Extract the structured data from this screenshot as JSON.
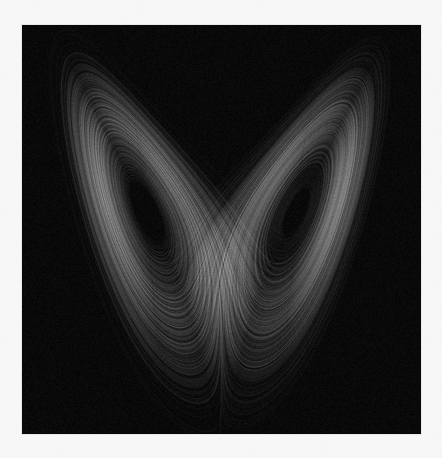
{
  "figure": {
    "kind": "lorenz-attractor-plot",
    "title": "",
    "caption": "",
    "page_background": "#f7f7f7",
    "plot_background": "#050505",
    "plot_border_color": "#e8e8e8",
    "plot_area": {
      "x": 22,
      "y": 25,
      "width": 399,
      "height": 409
    },
    "axes_visible": false,
    "ticks_visible": false,
    "gridlines_visible": false,
    "legend_visible": false,
    "labels_visible": false
  },
  "chart_data": {
    "type": "line",
    "title": "",
    "subtitle": "",
    "xlabel": "",
    "ylabel": "",
    "grid": false,
    "legend_position": "none",
    "projection": "x-z",
    "system": "Lorenz",
    "equations": [
      "dx/dt = sigma * (y - x)",
      "dy/dt = x * (rho - z) - y",
      "dz/dt = x * y - beta * z"
    ],
    "parameters": {
      "sigma": 10,
      "rho": 28,
      "beta": 2.6666667
    },
    "initial_conditions": {
      "x": 0.1,
      "y": 0.0,
      "z": 0.0
    },
    "integration": {
      "dt": 0.0032,
      "steps": 260000,
      "method": "rk4"
    },
    "xlim": [
      -22.5,
      22.5
    ],
    "ylim": [
      2.0,
      48.0
    ],
    "series": [
      {
        "name": "trajectory",
        "color": "#d8d8d8",
        "line_width": 0.35,
        "alpha": 0.07,
        "blend": "lighter"
      }
    ],
    "annotations": [],
    "visual_features": {
      "wing_count": 2,
      "left_wing_center": {
        "x": 150,
        "y": 225
      },
      "right_wing_center": {
        "x": 290,
        "y": 220
      },
      "saddle_crossing": {
        "x": 215,
        "y": 268
      },
      "left_wing_tip": {
        "x": 90,
        "y": 122
      },
      "right_wing_tip": {
        "x": 327,
        "y": 118
      },
      "lowest_point_y": 358,
      "brightest_value": "#909090",
      "darkest_value": "#050505"
    }
  }
}
